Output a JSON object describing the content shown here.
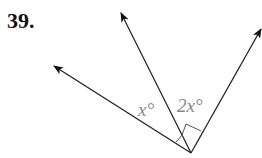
{
  "problem_number": "39.",
  "diagram": {
    "vertex": [
      191,
      153
    ],
    "rays": [
      {
        "name": "left-ray",
        "end": [
          53,
          66
        ]
      },
      {
        "name": "middle-ray",
        "end": [
          120,
          12
        ]
      },
      {
        "name": "right-ray",
        "end": [
          262,
          28
        ]
      }
    ],
    "angles": [
      {
        "label": "x°",
        "between": [
          "left-ray",
          "middle-ray"
        ]
      },
      {
        "label": "2x°",
        "between": [
          "middle-ray",
          "right-ray"
        ]
      }
    ],
    "right_angle_mark": {
      "between": [
        "left-ray",
        "right-ray"
      ]
    }
  },
  "labels": {
    "angle1": "x°",
    "angle2": "2x°"
  }
}
